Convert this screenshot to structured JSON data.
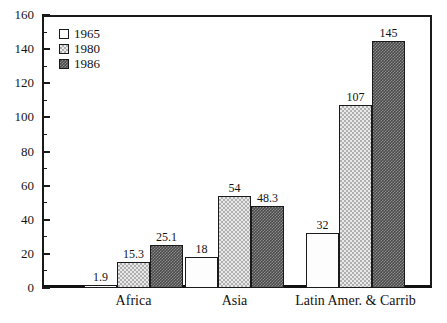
{
  "chart_data": {
    "type": "bar",
    "title": "",
    "xlabel": "",
    "ylabel": "",
    "ylim": [
      0,
      160
    ],
    "ytick_step": 20,
    "yminor_step": 10,
    "grid": false,
    "legend_position": "top-left",
    "categories": [
      "Africa",
      "Asia",
      "Latin Amer. & Carrib"
    ],
    "series": [
      {
        "name": "1965",
        "fill": "plain",
        "values": [
          1.9,
          18,
          32
        ]
      },
      {
        "name": "1980",
        "fill": "light",
        "values": [
          15.3,
          54,
          107
        ]
      },
      {
        "name": "1986",
        "fill": "dark",
        "values": [
          25.1,
          48.3,
          145
        ]
      }
    ],
    "ytick_labels": [
      "0",
      "20",
      "40",
      "60",
      "80",
      "100",
      "120",
      "140",
      "160"
    ],
    "value_labels": [
      [
        "1.9",
        "15.3",
        "25.1"
      ],
      [
        "18",
        "54",
        "48.3"
      ],
      [
        "32",
        "107",
        "145"
      ]
    ]
  },
  "legend": {
    "items": [
      {
        "label": "1965",
        "swatch": "swatch-plain"
      },
      {
        "label": "1980",
        "swatch": "swatch-light-checker"
      },
      {
        "label": "1986",
        "swatch": "swatch-dark-checker"
      }
    ]
  },
  "axis": {
    "y_labels": [
      "160",
      "140",
      "120",
      "100",
      "80",
      "60",
      "40",
      "20",
      "0"
    ]
  },
  "colors": {
    "axis": "#1a1a1a",
    "text": "#131313",
    "series_1965": "#fdfdfd",
    "series_1980": "#e9e9e9",
    "series_1986": "#4a4a4a",
    "background": "#ffffff"
  }
}
